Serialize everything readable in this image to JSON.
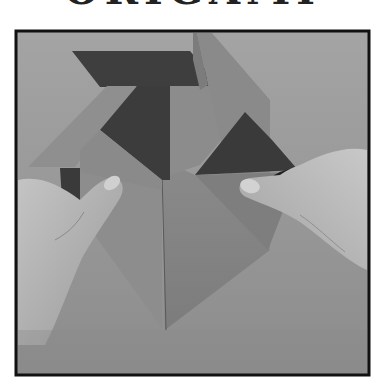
{
  "header": {
    "title_cropped": "ORIGAMI"
  },
  "photo": {
    "subject": "hands folding an origami model",
    "style": "grayscale photograph",
    "frame": {
      "x": 16,
      "y": 31,
      "width": 353,
      "height": 344,
      "border_color": "#111111"
    },
    "colors": {
      "background": "#9a9a9a",
      "paper_light": "#8e8e8e",
      "paper_mid": "#7a7a7a",
      "paper_dark": "#3c3c3c",
      "skin": "#b8b8b8",
      "shadow": "#262626"
    }
  }
}
